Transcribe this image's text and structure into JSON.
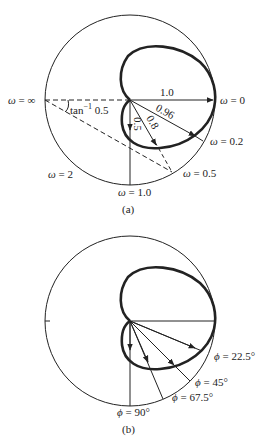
{
  "figure_a": {
    "caption": "(a)",
    "labels": {
      "w_inf": "ω = ∞",
      "w_0": "ω = 0",
      "w_02": "ω = 0.2",
      "w_05": "ω = 0.5",
      "w_1": "ω = 1.0",
      "w_2": "ω = 2",
      "angle": "tan",
      "angle_sup": "−1",
      "angle_val": "0.5"
    },
    "vectors": [
      {
        "label": "1.0",
        "angle_deg": 0,
        "length": 1.0
      },
      {
        "label": "0.96",
        "angle_deg": -22.5,
        "length": 0.96
      },
      {
        "label": "0.8",
        "angle_deg": -45,
        "length": 0.8
      },
      {
        "label": "0.5",
        "angle_deg": -90,
        "length": 0.5
      }
    ]
  },
  "figure_b": {
    "caption": "(b)",
    "labels": {
      "phi_225": "ϕ = 22.5°",
      "phi_45": "ϕ = 45°",
      "phi_675": "ϕ = 67.5°",
      "phi_90": "ϕ = 90°"
    }
  },
  "colors": {
    "ink": "#222222",
    "background": "#ffffff"
  }
}
